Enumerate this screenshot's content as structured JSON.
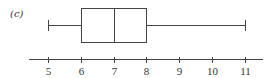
{
  "chart_data": {
    "type": "boxplot",
    "panel_label": "(c)",
    "title": "",
    "xlabel": "",
    "ylabel": "",
    "orientation": "horizontal",
    "box": {
      "min": 5,
      "q1": 6,
      "median": 7,
      "q3": 8,
      "max": 11
    },
    "axis": {
      "ticks": [
        5,
        6,
        7,
        8,
        9,
        10,
        11
      ],
      "tick_labels": [
        "5",
        "6",
        "7",
        "8",
        "9",
        "10",
        "11"
      ],
      "xlim": [
        4.4,
        11.6
      ]
    },
    "grid": false,
    "legend": null
  },
  "colors": {
    "line": "#444444",
    "text": "#333333",
    "background": "#ffffff"
  }
}
